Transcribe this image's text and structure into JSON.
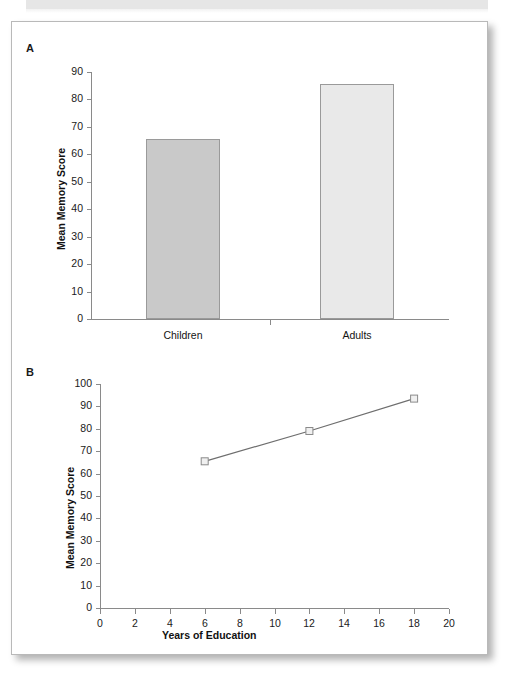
{
  "figure": {
    "panels": [
      {
        "label": "A"
      },
      {
        "label": "B"
      }
    ]
  },
  "chart_data": [
    {
      "type": "bar",
      "panel": "A",
      "title": "",
      "xlabel": "",
      "ylabel": "Mean Memory Score",
      "categories": [
        "Children",
        "Adults"
      ],
      "values": [
        65.5,
        85.5
      ],
      "ylim": [
        0,
        90
      ],
      "yticks": [
        0,
        10,
        20,
        30,
        40,
        50,
        60,
        70,
        80,
        90
      ],
      "bar_colors": [
        "#c9c9c9",
        "#e9e9e9"
      ],
      "bar_edge_color": "#9a9a9a",
      "grid": false,
      "legend": "none"
    },
    {
      "type": "line",
      "panel": "B",
      "title": "",
      "xlabel": "Years of Education",
      "ylabel": "Mean Memory Score",
      "x": [
        6,
        12,
        18
      ],
      "values": [
        65.5,
        79.0,
        93.5
      ],
      "xlim": [
        0,
        20
      ],
      "ylim": [
        0,
        100
      ],
      "xticks": [
        0,
        2,
        4,
        6,
        8,
        10,
        12,
        14,
        16,
        18,
        20
      ],
      "yticks": [
        0,
        10,
        20,
        30,
        40,
        50,
        60,
        70,
        80,
        90,
        100
      ],
      "line_color": "#6e6e6e",
      "marker": "open-square",
      "marker_edge_color": "#8a8a8a",
      "marker_face_color": "#f0f0f0",
      "grid": false,
      "legend": "none"
    }
  ],
  "colors": {
    "axis": "#8a8a8a",
    "text": "#1a1a1a",
    "card_border": "#b9b9b9",
    "top_band": "#e6e6e6"
  }
}
